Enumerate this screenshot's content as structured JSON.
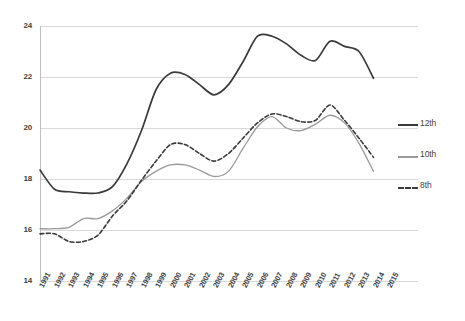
{
  "chart_data": {
    "type": "line",
    "title": "",
    "subtitle": "",
    "xlabel": "",
    "ylabel": "",
    "grid": "horizontal",
    "legend_position": "right",
    "xlim": [
      1991,
      2015
    ],
    "ylim": [
      14,
      24
    ],
    "y_ticks": [
      14,
      16,
      18,
      20,
      22,
      24
    ],
    "x_ticks": [
      "1991",
      "1992",
      "1993",
      "1994",
      "1995",
      "1996",
      "1997",
      "1998",
      "1999",
      "2000",
      "2001",
      "2002",
      "2003",
      "2004",
      "2005",
      "2006",
      "2007",
      "2008",
      "2009",
      "2010",
      "2011",
      "2012",
      "2013",
      "2014",
      "2015"
    ],
    "categories": [
      1991,
      1992,
      1993,
      1994,
      1995,
      1996,
      1997,
      1998,
      1999,
      2000,
      2001,
      2002,
      2003,
      2004,
      2005,
      2006,
      2007,
      2008,
      2009,
      2010,
      2011,
      2012,
      2013,
      2014
    ],
    "series": [
      {
        "name": "12th",
        "style": "solid",
        "color": "#3a3a3a",
        "width": 1.7,
        "values": [
          18.35,
          17.6,
          17.5,
          17.45,
          17.45,
          17.7,
          18.6,
          19.9,
          21.5,
          22.15,
          22.1,
          21.7,
          21.3,
          21.7,
          22.6,
          23.6,
          23.6,
          23.3,
          22.85,
          22.65,
          23.4,
          23.2,
          23.0,
          21.95
        ]
      },
      {
        "name": "10th",
        "style": "solid",
        "color": "#9a9a9a",
        "width": 1.3,
        "values": [
          16.05,
          16.05,
          16.1,
          16.45,
          16.45,
          16.75,
          17.25,
          17.9,
          18.3,
          18.55,
          18.55,
          18.35,
          18.1,
          18.3,
          19.2,
          20.05,
          20.45,
          20.0,
          19.9,
          20.15,
          20.5,
          20.2,
          19.4,
          18.3
        ]
      },
      {
        "name": "8th",
        "style": "dashed",
        "color": "#3a3a3a",
        "width": 1.6,
        "values": [
          15.85,
          15.85,
          15.55,
          15.55,
          15.8,
          16.55,
          17.15,
          17.95,
          18.7,
          19.35,
          19.35,
          19.0,
          18.7,
          19.0,
          19.6,
          20.2,
          20.55,
          20.45,
          20.25,
          20.3,
          20.9,
          20.3,
          19.6,
          18.85
        ]
      }
    ]
  },
  "legend": {
    "items": [
      {
        "label": "12th"
      },
      {
        "label": "10th"
      },
      {
        "label": "8th"
      }
    ]
  },
  "axes": {
    "y_tick_labels": [
      "24",
      "22",
      "20",
      "18",
      "16",
      "14"
    ],
    "x_tick_labels": [
      "1991",
      "1992",
      "1993",
      "1994",
      "1995",
      "1996",
      "1997",
      "1998",
      "1999",
      "2000",
      "2001",
      "2002",
      "2003",
      "2004",
      "2005",
      "2006",
      "2007",
      "2008",
      "2009",
      "2010",
      "2011",
      "2012",
      "2013",
      "2014",
      "2015"
    ]
  },
  "colors": {
    "grade12": "#3a3a3a",
    "grade10": "#9a9a9a",
    "grade8": "#3a3a3a",
    "grid": "#d9d9d9",
    "axis": "#bfbfbf",
    "text": "#3f3f3f",
    "background": "#ffffff"
  }
}
